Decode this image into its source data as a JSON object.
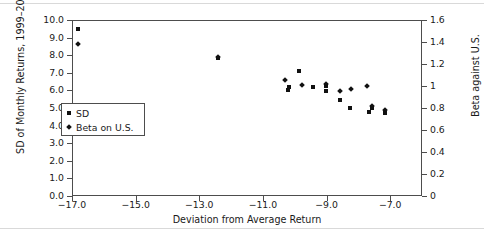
{
  "chart_data": {
    "type": "scatter",
    "title": "",
    "xlabel": "Deviation from Average Return",
    "ylabel_left": "SD of Monthly Returns, 1999–2008",
    "ylabel_right": "Beta against U.S.",
    "xlim": [
      -17.0,
      -6.0
    ],
    "xticks": [
      "−17.0",
      "−15.0",
      "−13.0",
      "−11.0",
      "−9.0",
      "−7.0"
    ],
    "xtick_values": [
      -17.0,
      -15.0,
      -13.0,
      -11.0,
      -9.0,
      -7.0
    ],
    "ylim_left": [
      0.0,
      10.0
    ],
    "yticks_left": [
      "0.0",
      "1.0",
      "2.0",
      "3.0",
      "4.0",
      "5.0",
      "6.0",
      "7.0",
      "8.0",
      "9.0",
      "10.0"
    ],
    "ytick_values_left": [
      0.0,
      1.0,
      2.0,
      3.0,
      4.0,
      5.0,
      6.0,
      7.0,
      8.0,
      9.0,
      10.0
    ],
    "ylim_right": [
      0,
      1.6
    ],
    "yticks_right": [
      "0",
      "0.2",
      "0.4",
      "0.6",
      "0.8",
      "1",
      "1.2",
      "1.4",
      "1.6"
    ],
    "ytick_values_right": [
      0,
      0.2,
      0.4,
      0.6,
      0.8,
      1.0,
      1.2,
      1.4,
      1.6
    ],
    "grid": false,
    "legend_position": "upper-left-inside",
    "marker_color": "#111111",
    "series": [
      {
        "name": "SD",
        "marker": "square",
        "axis": "left",
        "points": [
          {
            "x": -16.85,
            "y": 9.55
          },
          {
            "x": -12.45,
            "y": 7.9
          },
          {
            "x": -10.25,
            "y": 6.1
          },
          {
            "x": -10.2,
            "y": 6.25
          },
          {
            "x": -9.9,
            "y": 7.15
          },
          {
            "x": -9.45,
            "y": 6.25
          },
          {
            "x": -9.05,
            "y": 6.3
          },
          {
            "x": -9.05,
            "y": 6.05
          },
          {
            "x": -8.6,
            "y": 5.5
          },
          {
            "x": -8.3,
            "y": 5.05
          },
          {
            "x": -7.7,
            "y": 4.85
          },
          {
            "x": -7.6,
            "y": 5.05
          },
          {
            "x": -7.2,
            "y": 4.8
          }
        ]
      },
      {
        "name": "Beta on U.S.",
        "marker": "diamond",
        "axis": "right",
        "points": [
          {
            "x": -16.85,
            "y": 1.39
          },
          {
            "x": -12.45,
            "y": 1.27
          },
          {
            "x": -10.35,
            "y": 1.06
          },
          {
            "x": -9.8,
            "y": 1.02
          },
          {
            "x": -9.05,
            "y": 1.03
          },
          {
            "x": -8.6,
            "y": 0.96
          },
          {
            "x": -8.25,
            "y": 0.98
          },
          {
            "x": -7.75,
            "y": 1.01
          },
          {
            "x": -7.6,
            "y": 0.83
          },
          {
            "x": -7.2,
            "y": 0.79
          }
        ]
      }
    ]
  },
  "legend": {
    "items": [
      {
        "label": "SD",
        "marker": "square"
      },
      {
        "label": "Beta on U.S.",
        "marker": "diamond"
      }
    ]
  }
}
